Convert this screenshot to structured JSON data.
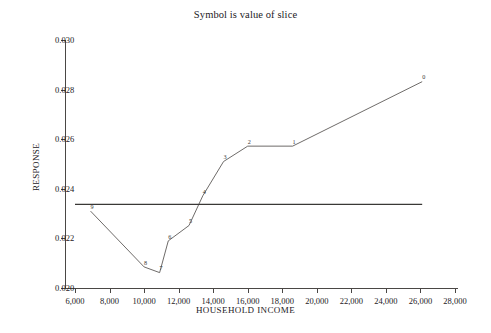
{
  "chart_data": {
    "type": "line",
    "title": "Symbol is value of slice",
    "xlabel": "HOUSEHOLD INCOME",
    "ylabel": "RESPONSE",
    "xlim": [
      6000,
      28000
    ],
    "ylim": [
      0.02,
      0.03
    ],
    "grid": false,
    "legend": null,
    "x_ticks": [
      6000,
      8000,
      10000,
      12000,
      14000,
      16000,
      18000,
      20000,
      22000,
      24000,
      26000,
      28000
    ],
    "x_tick_labels": [
      "6,000",
      "8,000",
      "10,000",
      "12,000",
      "14,000",
      "16,000",
      "18,000",
      "20,000",
      "22,000",
      "24,000",
      "26,000",
      "28,000"
    ],
    "y_ticks": [
      0.02,
      0.022,
      0.024,
      0.026,
      0.028,
      0.03
    ],
    "y_tick_labels": [
      "0.020",
      "0.022",
      "0.024",
      "0.026",
      "0.028",
      "0.030"
    ],
    "series": [
      {
        "name": "slice response",
        "marker_style": "digit-label",
        "points": [
          {
            "label": "9",
            "x": 6900,
            "y": 0.0231
          },
          {
            "label": "8",
            "x": 10000,
            "y": 0.02085
          },
          {
            "label": "7",
            "x": 10900,
            "y": 0.02062
          },
          {
            "label": "6",
            "x": 11400,
            "y": 0.0219
          },
          {
            "label": "5",
            "x": 12600,
            "y": 0.02252
          },
          {
            "label": "4",
            "x": 13400,
            "y": 0.02372
          },
          {
            "label": "3",
            "x": 14600,
            "y": 0.0251
          },
          {
            "label": "2",
            "x": 16000,
            "y": 0.02572
          },
          {
            "label": "1",
            "x": 18600,
            "y": 0.02572
          },
          {
            "label": "0",
            "x": 26100,
            "y": 0.02832
          }
        ]
      }
    ],
    "reference_lines": [
      {
        "name": "overall-mean-response",
        "orientation": "horizontal",
        "y": 0.02337,
        "x_start": 6000,
        "x_end": 26100
      }
    ],
    "colors": {
      "line": "#5d5a58",
      "reference_line": "#3a3836",
      "axis": "#4a4745",
      "text": "#23201e",
      "background": "#ffffff"
    }
  }
}
